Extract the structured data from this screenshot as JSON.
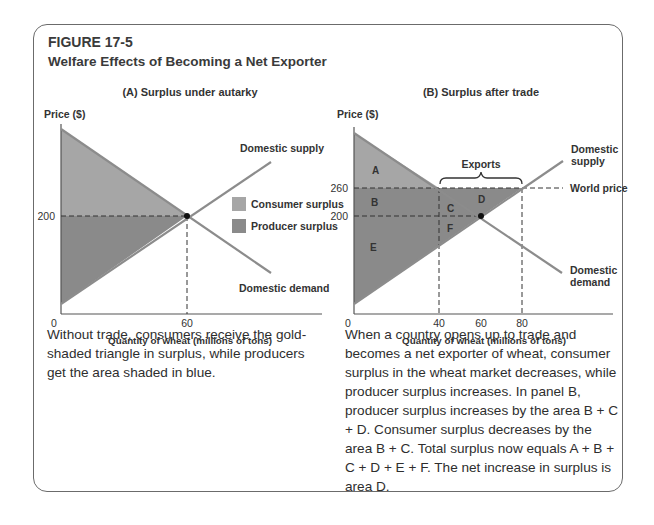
{
  "figure": {
    "number": "FIGURE 17-5",
    "title": "Welfare Effects of Becoming a Net Exporter"
  },
  "panel_a": {
    "title": "(A) Surplus under autarky",
    "y_axis_label": "Price ($)",
    "x_axis_label": "Quantity of wheat (millions of tons)",
    "x_ticks": [
      "0",
      "60"
    ],
    "y_ticks": [
      "200"
    ],
    "supply_label": "Domestic supply",
    "demand_label": "Domestic demand",
    "legend": [
      {
        "label": "Consumer surplus",
        "color": "#a6a6a6"
      },
      {
        "label": "Producer surplus",
        "color": "#8a8a8a"
      }
    ],
    "caption": "Without trade, consumers receive the gold-shaded triangle in surplus, while producers get the area shaded in blue."
  },
  "panel_b": {
    "title": "(B) Surplus after trade",
    "y_axis_label": "Price ($)",
    "x_axis_label": "Quantity of wheat (millions of tons)",
    "x_ticks": [
      "0",
      "40",
      "60",
      "80"
    ],
    "y_ticks": [
      "260",
      "200"
    ],
    "supply_label_line1": "Domestic",
    "supply_label_line2": "supply",
    "demand_label_line1": "Domestic",
    "demand_label_line2": "demand",
    "world_price_label": "World price",
    "exports_label": "Exports",
    "areas": [
      "A",
      "B",
      "C",
      "D",
      "E",
      "F"
    ],
    "caption": "When a country opens up to trade and becomes a net exporter of wheat, consumer surplus in the wheat market decreases, while producer surplus increases. In panel B, producer surplus increases by the area B + C + D. Consumer surplus decreases by the area B + C. Total surplus now equals A + B + C + D + E + F. The net increase in surplus is area D."
  },
  "colors": {
    "consumer_surplus": "#a6a6a6",
    "producer_surplus": "#8a8a8a",
    "curve": "#8c8c8c",
    "axis": "#555555",
    "border": "#6b6b6b"
  }
}
